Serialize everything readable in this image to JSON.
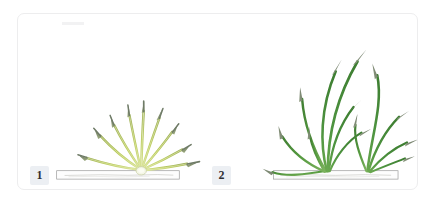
{
  "figure": {
    "background_color": "#ffffff",
    "card_border_color": "#ededee",
    "badge_background_color": "#eceff3",
    "badge_text_color": "#2f2f33",
    "panels": [
      {
        "step_number": "1",
        "caption": "",
        "stage_name": "germination-radial-sprouts",
        "sprout_count": 9,
        "stem_color": "#b9cc5c",
        "stem_highlight_color": "#d8e38a",
        "tip_color": "#7f8d72",
        "seed_color": "#e9edd6",
        "soil_line_color": "#8c8c8c",
        "soil_fill_color": "#fcfcfc"
      },
      {
        "step_number": "2",
        "caption": "",
        "stage_name": "mature-grass-tufts",
        "tuft_count": 2,
        "blade_count": 13,
        "blade_color": "#4f9440",
        "blade_dark_color": "#3c7a30",
        "tip_color": "#7b8a73",
        "soil_line_color": "#8c8c8c",
        "soil_fill_color": "#fcfcfc"
      }
    ]
  }
}
